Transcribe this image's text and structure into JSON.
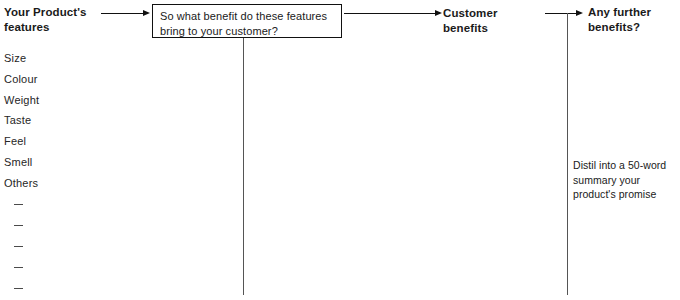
{
  "diagram": {
    "background_color": "#ffffff",
    "line_color": "#111111",
    "text_color": "#1a1a1a"
  },
  "left_column": {
    "heading": "Your Product's\nfeatures",
    "items": [
      "Size",
      "Colour",
      "Weight",
      "Taste",
      "Feel",
      "Smell",
      "Others"
    ],
    "blank_lines": 5,
    "blank_glyph": "—"
  },
  "question_box": {
    "text": "So what benefit do these features\nbring to your customer?"
  },
  "center_column": {
    "heading": "Customer benefits"
  },
  "right_column": {
    "heading": "Any further\nbenefits?",
    "note": "Distil into a 50-word\nsummary your\nproduct's promise"
  },
  "connectors": [
    {
      "name": "features-to-question",
      "direction": "right"
    },
    {
      "name": "question-to-customer-benefits",
      "direction": "right"
    },
    {
      "name": "customer-benefits-to-any-further",
      "direction": "right"
    }
  ]
}
